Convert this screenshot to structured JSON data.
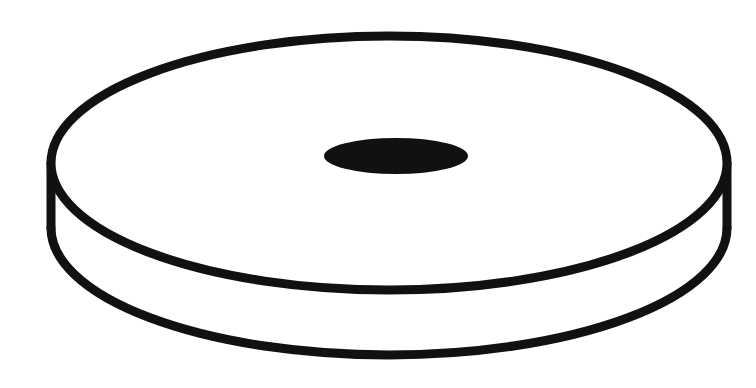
{
  "figure": {
    "parts": [
      {
        "id": "top-face",
        "label": "Top face"
      },
      {
        "id": "side-wall",
        "label": "Side wall (thickness)"
      },
      {
        "id": "bottom-edge",
        "label": "Bottom edge"
      },
      {
        "id": "center-hole",
        "label": "Center hole"
      }
    ],
    "colors": {
      "line": "#111111",
      "fill": "#ffffff",
      "hole": "#111111"
    }
  }
}
